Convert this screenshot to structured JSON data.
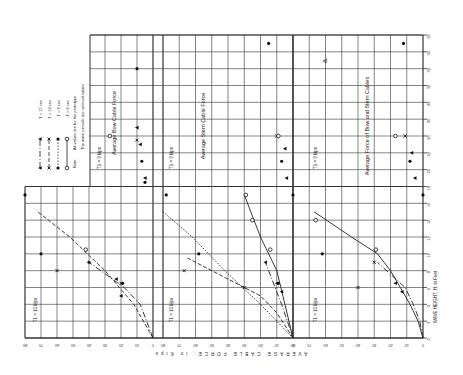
{
  "chart_data": [
    {
      "type": "scatter",
      "title": "Average Bow Cable Force",
      "xlabel": "WAVE HEIGHT, H, in Feet",
      "ylabel": "AVERAGE CABLE FORCE, in Kips",
      "xlim": [
        0,
        36
      ],
      "ylim": [
        0,
        80
      ],
      "orientation_note": "figure rotated 90 degrees counterclockwise",
      "annotations": [
        "T1 = 10 kips",
        "T1 = 3 kips"
      ],
      "series": [
        {
          "name": "T = 15 sec",
          "marker": "triangle",
          "line": "dash-dot",
          "points": [
            [
              7,
              23
            ],
            [
              19,
              5
            ],
            [
              25,
              10
            ],
            [
              23,
              8
            ],
            [
              5,
              20
            ]
          ]
        },
        {
          "name": "T = 12 sec",
          "marker": "x",
          "line": "dashed",
          "points": [
            [
              8,
              60
            ],
            [
              23.5,
              10
            ],
            [
              6.5,
              20
            ]
          ]
        },
        {
          "name": "T = 9 sec",
          "marker": "filled-circle",
          "line": "dotted",
          "points": [
            [
              17,
              80
            ],
            [
              10,
              70
            ],
            [
              9,
              40
            ],
            [
              6.5,
              19
            ],
            [
              18.5,
              5
            ],
            [
              21,
              7
            ],
            [
              32,
              10
            ]
          ]
        },
        {
          "name": "T = 6 sec",
          "marker": "open-circle",
          "line": "solid",
          "points": [
            [
              10.5,
              42
            ],
            [
              24,
              27
            ]
          ]
        }
      ],
      "curves": [
        {
          "series": "T = 12 sec",
          "points": [
            [
              0,
              0
            ],
            [
              4,
              12
            ],
            [
              8,
              30
            ],
            [
              12,
              52
            ],
            [
              15,
              72
            ]
          ]
        },
        {
          "series": "T = 15 sec",
          "points": [
            [
              0,
              0
            ],
            [
              4,
              8
            ],
            [
              6,
              18
            ],
            [
              9,
              40
            ]
          ]
        }
      ]
    },
    {
      "type": "scatter",
      "title": "Average Stern Cable Force",
      "xlim": [
        0,
        36
      ],
      "ylim": [
        0,
        80
      ],
      "annotations": [
        "T1 = 10 kips",
        "T1 = 3 kips"
      ],
      "series": [
        {
          "name": "T = 15 sec",
          "marker": "triangle",
          "line": "dash-dot",
          "points": [
            [
              9,
              17
            ],
            [
              6.5,
              10
            ],
            [
              5.5,
              7
            ],
            [
              19,
              4
            ],
            [
              22.5,
              5
            ]
          ]
        },
        {
          "name": "T = 12 sec",
          "marker": "x",
          "line": "dashed",
          "points": [
            [
              8,
              67
            ],
            [
              6,
              30
            ],
            [
              24,
              10
            ]
          ]
        },
        {
          "name": "T = 9 sec",
          "marker": "filled-circle",
          "line": "dotted",
          "points": [
            [
              17,
              78
            ],
            [
              10,
              58
            ],
            [
              6.5,
              9
            ],
            [
              35,
              15
            ],
            [
              21,
              7
            ],
            [
              17,
              0
            ]
          ]
        },
        {
          "name": "T = 6 sec",
          "marker": "open-circle",
          "line": "solid",
          "points": [
            [
              17,
              29
            ],
            [
              14,
              25
            ],
            [
              10.5,
              14
            ],
            [
              24,
              9
            ]
          ]
        }
      ],
      "curves": [
        {
          "series": "T = 9 sec",
          "points": [
            [
              0,
              0
            ],
            [
              4,
              20
            ],
            [
              8,
              42
            ],
            [
              12,
              62
            ],
            [
              15,
              80
            ]
          ]
        },
        {
          "series": "T = 12 sec",
          "points": [
            [
              0,
              0
            ],
            [
              3,
              10
            ],
            [
              5,
              20
            ],
            [
              8,
              50
            ],
            [
              9.5,
              65
            ]
          ]
        },
        {
          "series": "T = 15 sec",
          "points": [
            [
              0,
              0
            ],
            [
              4,
              7
            ],
            [
              9,
              17
            ]
          ]
        },
        {
          "series": "T = 6 sec",
          "points": [
            [
              0,
              0
            ],
            [
              4,
              5
            ],
            [
              8,
              10
            ],
            [
              12,
              20
            ],
            [
              17,
              30
            ]
          ]
        }
      ]
    },
    {
      "type": "scatter",
      "title": "Average Force of Bow and Stern Cables",
      "xlim": [
        0,
        36
      ],
      "ylim": [
        0,
        80
      ],
      "annotations": [
        "T1 = 10 kips",
        "T1 = 3 kips",
        "a."
      ],
      "series": [
        {
          "name": "T = 15 sec",
          "marker": "triangle",
          "line": "dash-dot",
          "points": [
            [
              6.5,
              17
            ],
            [
              5.5,
              13
            ],
            [
              19,
              5
            ],
            [
              22,
              7
            ]
          ]
        },
        {
          "name": "T = 12 sec",
          "marker": "x",
          "line": "dashed",
          "points": [
            [
              9,
              30
            ],
            [
              6,
              40
            ],
            [
              24,
              11
            ]
          ]
        },
        {
          "name": "T = 9 sec",
          "marker": "filled-circle",
          "line": "dotted",
          "points": [
            [
              17,
              0
            ],
            [
              10,
              62
            ],
            [
              21,
              8
            ],
            [
              35,
              12
            ]
          ]
        },
        {
          "name": "T = 6 sec",
          "marker": "open-circle",
          "line": "solid",
          "points": [
            [
              14,
              66
            ],
            [
              10.5,
              29
            ],
            [
              24,
              17
            ]
          ]
        }
      ],
      "curves": [
        {
          "series": "T = 6 sec",
          "points": [
            [
              0,
              0
            ],
            [
              2,
              3
            ],
            [
              4,
              8
            ],
            [
              6,
              14
            ],
            [
              8,
              20
            ],
            [
              10,
              28
            ],
            [
              12,
              44
            ],
            [
              15,
              67
            ]
          ]
        },
        {
          "series": "T = 15 sec",
          "points": [
            [
              0,
              0
            ],
            [
              2,
              2
            ],
            [
              4,
              6
            ],
            [
              6,
              11
            ],
            [
              9,
              28
            ]
          ]
        }
      ]
    }
  ],
  "legend": {
    "note_label": "Note",
    "note_lines": [
      "All values are for the prototype",
      "The wave periods are nominal values"
    ],
    "entries": [
      "T = 15 sec",
      "T = 12 sec",
      "T = 9 sec",
      "T = 6 sec"
    ]
  },
  "axis": {
    "force_label": "AVERAGE CABLE FORCE, in Kips",
    "height_label": "WAVE HEIGHT, H, in Feet",
    "height_ticks": [
      0,
      2,
      4,
      6,
      8,
      10,
      12,
      14,
      16,
      18,
      20,
      22,
      24,
      26,
      28,
      30,
      32,
      34,
      36
    ],
    "force_ticks": [
      0,
      10,
      20,
      30,
      40,
      50,
      60,
      70,
      80
    ]
  },
  "labels": {
    "t1_high": "T1 = 10 kips",
    "t1_low": "T1 = 3 kips",
    "panel_letter": "a."
  }
}
